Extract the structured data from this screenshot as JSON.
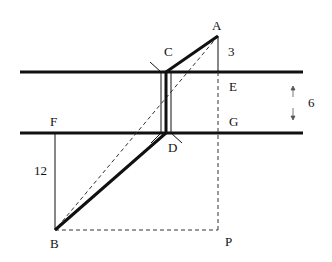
{
  "diagram": {
    "points": {
      "A": {
        "label": "A",
        "x": 218,
        "y": 36
      },
      "C": {
        "label": "C",
        "x": 166,
        "y": 72
      },
      "E": {
        "label": "E",
        "x": 218,
        "y": 72
      },
      "D": {
        "label": "D",
        "x": 166,
        "y": 133
      },
      "G": {
        "label": "G",
        "x": 218,
        "y": 133
      },
      "F": {
        "label": "F",
        "x": 55,
        "y": 133
      },
      "B": {
        "label": "B",
        "x": 55,
        "y": 230
      },
      "P": {
        "label": "P",
        "x": 218,
        "y": 230
      }
    },
    "measurements": {
      "AE": "3",
      "river_width": "6",
      "FB": "12"
    },
    "colors": {
      "line": "#111111",
      "dashed": "#333333",
      "background": "#ffffff"
    }
  }
}
